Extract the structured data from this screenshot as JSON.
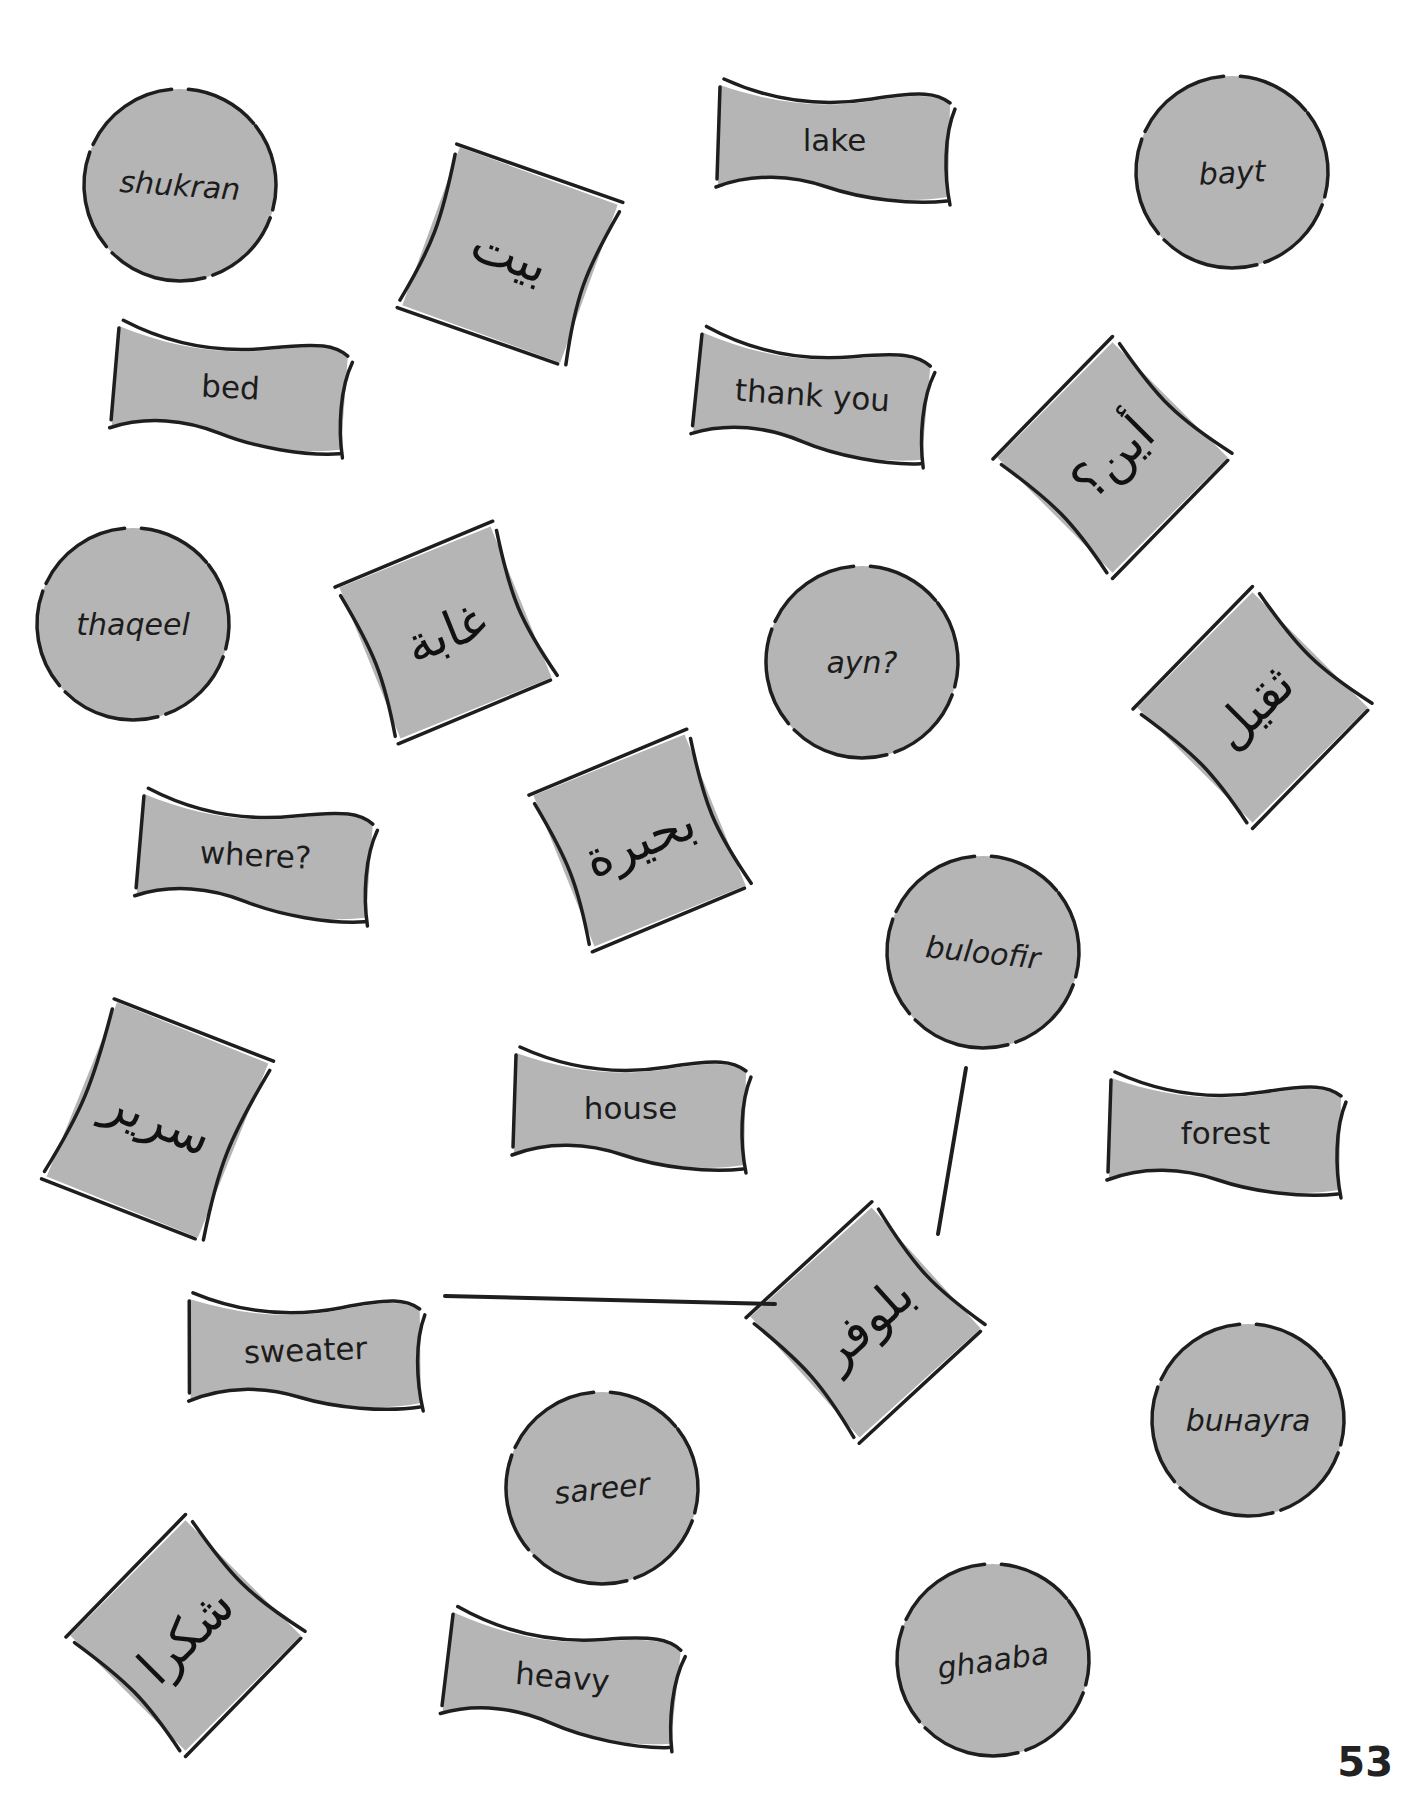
{
  "page": {
    "page_number": "53",
    "colors": {
      "card_fill": "#b5b5b5",
      "outline": "#1e1e1e",
      "background": "#ffffff"
    }
  },
  "cards": [
    {
      "id": "shukran",
      "kind": "transliteration",
      "shape": "circle",
      "text": "shukran",
      "x": 80,
      "y": 85,
      "w": 200,
      "h": 200,
      "rot": 0,
      "text_rot": 4
    },
    {
      "id": "lake",
      "kind": "english",
      "shape": "flag",
      "text": "lake",
      "x": 712,
      "y": 75,
      "w": 245,
      "h": 130,
      "rot": 0
    },
    {
      "id": "bayt",
      "kind": "transliteration",
      "shape": "circle",
      "text": "bayt",
      "x": 1132,
      "y": 72,
      "w": 200,
      "h": 200,
      "rot": 0,
      "text_rot": -3
    },
    {
      "id": "bayt-ar",
      "kind": "arabic",
      "shape": "square",
      "text": "بيت",
      "x": 420,
      "y": 165,
      "w": 180,
      "h": 180,
      "rot": 20
    },
    {
      "id": "bed",
      "kind": "english",
      "shape": "flag",
      "text": "bed",
      "x": 108,
      "y": 322,
      "w": 245,
      "h": 130,
      "rot": 3
    },
    {
      "id": "thank-you",
      "kind": "english",
      "shape": "flag",
      "text": "thank you",
      "x": 690,
      "y": 330,
      "w": 245,
      "h": 130,
      "rot": 4
    },
    {
      "id": "ayn-ar",
      "kind": "arabic",
      "shape": "square",
      "text": "أين؟",
      "x": 1025,
      "y": 370,
      "w": 175,
      "h": 175,
      "rot": -45
    },
    {
      "id": "thaqeel",
      "kind": "transliteration",
      "shape": "circle",
      "text": "thaqeel",
      "x": 33,
      "y": 524,
      "w": 200,
      "h": 200,
      "rot": 0,
      "text_rot": 0
    },
    {
      "id": "ghaaba-ar",
      "kind": "arabic",
      "shape": "square",
      "text": "غابة",
      "x": 358,
      "y": 545,
      "w": 175,
      "h": 175,
      "rot": -22
    },
    {
      "id": "ayn",
      "kind": "transliteration",
      "shape": "circle",
      "text": "ayn?",
      "x": 762,
      "y": 562,
      "w": 200,
      "h": 200,
      "rot": 0,
      "text_rot": 0
    },
    {
      "id": "thaqeel-ar",
      "kind": "arabic",
      "shape": "square",
      "text": "ثقيل",
      "x": 1165,
      "y": 620,
      "w": 175,
      "h": 175,
      "rot": -45
    },
    {
      "id": "where",
      "kind": "english",
      "shape": "flag",
      "text": "where?",
      "x": 133,
      "y": 790,
      "w": 245,
      "h": 130,
      "rot": 3
    },
    {
      "id": "buhayra-ar",
      "kind": "arabic",
      "shape": "square",
      "text": "بحيرة",
      "x": 552,
      "y": 753,
      "w": 175,
      "h": 175,
      "rot": -22
    },
    {
      "id": "buloofir",
      "kind": "transliteration",
      "shape": "circle",
      "text": "buloofir",
      "x": 883,
      "y": 852,
      "w": 200,
      "h": 200,
      "rot": 0,
      "text_rot": 6
    },
    {
      "id": "sareer-ar",
      "kind": "arabic",
      "shape": "square",
      "text": "سرير",
      "x": 70,
      "y": 1020,
      "w": 175,
      "h": 200,
      "rot": 22
    },
    {
      "id": "house",
      "kind": "english",
      "shape": "flag",
      "text": "house",
      "x": 508,
      "y": 1043,
      "w": 245,
      "h": 130,
      "rot": 0
    },
    {
      "id": "forest",
      "kind": "english",
      "shape": "flag",
      "text": "forest",
      "x": 1103,
      "y": 1068,
      "w": 245,
      "h": 130,
      "rot": 0
    },
    {
      "id": "buloofir-ar",
      "kind": "arabic",
      "shape": "square",
      "text": "بلوفر",
      "x": 778,
      "y": 1235,
      "w": 175,
      "h": 175,
      "rot": -42
    },
    {
      "id": "sweater",
      "kind": "english",
      "shape": "flag",
      "text": "sweater",
      "x": 183,
      "y": 1285,
      "w": 245,
      "h": 130,
      "rot": -2
    },
    {
      "id": "buhayra",
      "kind": "transliteration",
      "shape": "circle",
      "text": "buнayra",
      "x": 1148,
      "y": 1320,
      "w": 200,
      "h": 200,
      "rot": 0,
      "text_rot": 0
    },
    {
      "id": "sareer",
      "kind": "transliteration",
      "shape": "circle",
      "text": "sareer",
      "x": 502,
      "y": 1388,
      "w": 200,
      "h": 200,
      "rot": 0,
      "text_rot": -6
    },
    {
      "id": "shukran-ar",
      "kind": "arabic",
      "shape": "square",
      "text": "شكرا",
      "x": 98,
      "y": 1548,
      "w": 175,
      "h": 175,
      "rot": -45
    },
    {
      "id": "heavy",
      "kind": "english",
      "shape": "flag",
      "text": "heavy",
      "x": 440,
      "y": 1612,
      "w": 245,
      "h": 130,
      "rot": 5
    },
    {
      "id": "ghaaba",
      "kind": "transliteration",
      "shape": "circle",
      "text": "ghaaba",
      "x": 893,
      "y": 1560,
      "w": 200,
      "h": 200,
      "rot": 0,
      "text_rot": -8
    }
  ],
  "connectors": [
    {
      "id": "sweater-to-buloofir-ar",
      "x1": 445,
      "y1": 1296,
      "x2": 775,
      "y2": 1304
    },
    {
      "id": "buloofir-ar-to-buloofir",
      "x1": 938,
      "y1": 1234,
      "x2": 966,
      "y2": 1068
    }
  ]
}
